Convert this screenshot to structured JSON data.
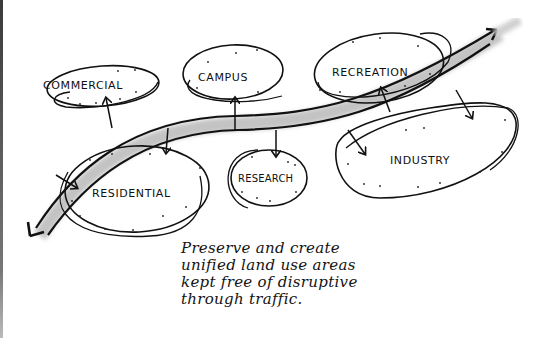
{
  "diagram": {
    "type": "hand-drawn land-use concept sketch",
    "zones": [
      {
        "id": "commercial",
        "label": "COMMERCIAL"
      },
      {
        "id": "campus",
        "label": "CAMPUS"
      },
      {
        "id": "recreation",
        "label": "RECREATION"
      },
      {
        "id": "residential",
        "label": "RESIDENTIAL"
      },
      {
        "id": "research",
        "label": "RESEARCH"
      },
      {
        "id": "industry",
        "label": "INDUSTRY"
      }
    ],
    "connector": {
      "description": "through-traffic road, two-headed arrow sweeping from lower-left to upper-right",
      "access_arrows": [
        "commercial",
        "campus",
        "recreation",
        "residential",
        "research",
        "industry"
      ]
    },
    "caption_lines": [
      "Preserve and create",
      "unified land use areas",
      "kept free of disruptive",
      "through traffic."
    ],
    "colors": {
      "ink": "#111111",
      "road_shadow": "#b5b5b5",
      "background": "#ffffff"
    }
  }
}
